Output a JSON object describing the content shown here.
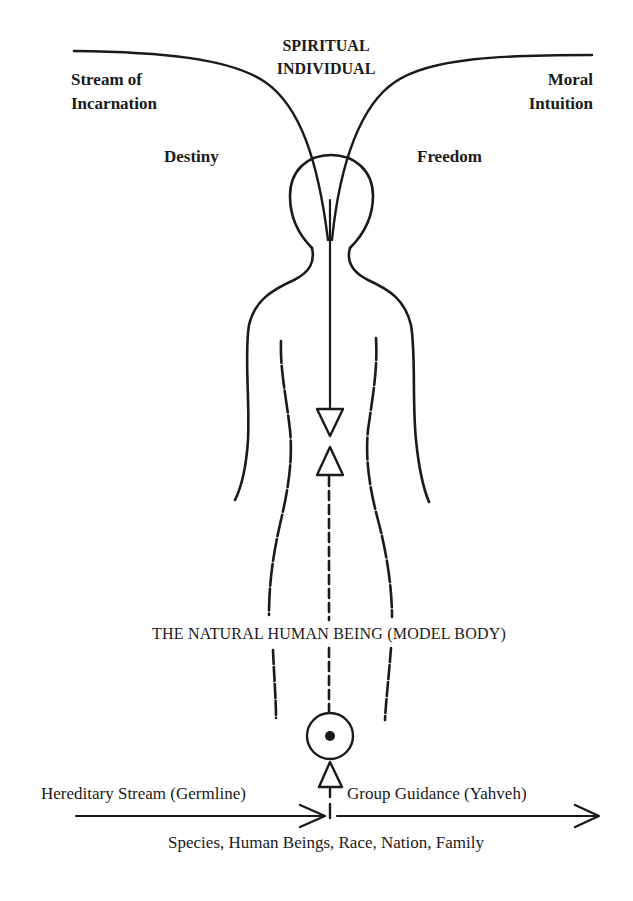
{
  "diagram": {
    "title": {
      "line1": "SPIRITUAL",
      "line2": "INDIVIDUAL"
    },
    "top_left": {
      "line1": "Stream of",
      "line2": "Incarnation"
    },
    "top_right": {
      "line1": "Moral",
      "line2": "Intuition"
    },
    "left_mid": "Destiny",
    "right_mid": "Freedom",
    "body_label": "THE NATURAL HUMAN BEING (MODEL BODY)",
    "bottom_left": "Hereditary Stream (Germline)",
    "bottom_right": "Group Guidance (Yahveh)",
    "bottom_caption": "Species, Human Beings, Race, Nation, Family",
    "colors": {
      "ink": "#1a1a1a",
      "background": "#ffffff"
    }
  }
}
